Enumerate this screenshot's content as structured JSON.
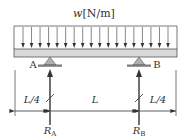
{
  "diagram": {
    "type": "simply-supported beam with overhangs under uniform distributed load",
    "load": {
      "symbol": "w",
      "unit": "[N/m]",
      "arrow_count": 18
    },
    "supports": [
      {
        "name": "A",
        "reaction": "R",
        "reaction_sub": "A"
      },
      {
        "name": "B",
        "reaction": "R",
        "reaction_sub": "B"
      }
    ],
    "dimensions": [
      {
        "label": "L/4"
      },
      {
        "label": "L"
      },
      {
        "label": "L/4"
      }
    ],
    "colors": {
      "beam_fill": "#d9d9d9",
      "support_fill": "#b0b0b0",
      "line": "#333333"
    }
  }
}
